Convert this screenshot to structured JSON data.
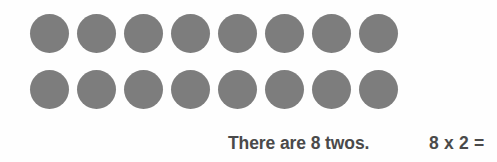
{
  "canvas": {
    "width": 497,
    "height": 162,
    "background_color": "#fefefe"
  },
  "array": {
    "dot_color": "#7d7d7d",
    "dot_shape": "circle",
    "rows": 2,
    "columns": 8,
    "total_count": 16,
    "grid": [
      [
        {
          "label": "counter"
        },
        {
          "label": "counter"
        },
        {
          "label": "counter"
        },
        {
          "label": "counter"
        },
        {
          "label": "counter"
        },
        {
          "label": "counter"
        },
        {
          "label": "counter"
        },
        {
          "label": "counter"
        }
      ],
      [
        {
          "label": "counter"
        },
        {
          "label": "counter"
        },
        {
          "label": "counter"
        },
        {
          "label": "counter"
        },
        {
          "label": "counter"
        },
        {
          "label": "counter"
        },
        {
          "label": "counter"
        },
        {
          "label": "counter"
        }
      ]
    ]
  },
  "caption": {
    "sentence": "There are 8 twos.",
    "equation": "8 x 2 =",
    "text_color": "#4a4a4a"
  },
  "chart_data": {
    "type": "table",
    "title": "There are 8 twos.",
    "groups": 8,
    "group_size": 2,
    "values": [
      2,
      2,
      2,
      2,
      2,
      2,
      2,
      2
    ],
    "categories": [
      "1",
      "2",
      "3",
      "4",
      "5",
      "6",
      "7",
      "8"
    ],
    "total": 16,
    "equation": "8 x 2 =",
    "xlabel": "",
    "ylabel": "",
    "legend": []
  }
}
